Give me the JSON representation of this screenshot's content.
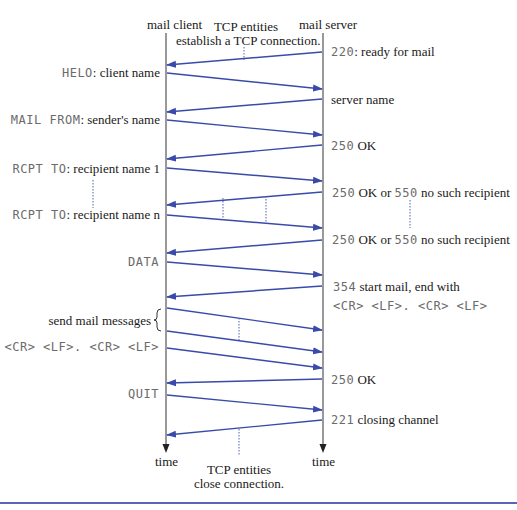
{
  "title_client": "mail client",
  "title_server": "mail server",
  "tcp_open_note": [
    "TCP entities",
    "establish a TCP connection."
  ],
  "tcp_close_note": [
    "TCP entities",
    "close connection."
  ],
  "time_label_client": "time",
  "time_label_server": "time",
  "colors": {
    "arrow": "#3a4aa8",
    "lifeline": "#555555",
    "dotted": "#5060b0",
    "rule": "#5a64b4"
  },
  "client_messages": [
    {
      "code": "HELO",
      "sep": ":",
      "text": " client name"
    },
    {
      "code": "MAIL FROM",
      "sep": ":",
      "text": " sender's name"
    },
    {
      "code": "RCPT TO",
      "sep": ":",
      "text": " recipient name 1"
    },
    {
      "code": "RCPT TO",
      "sep": ":",
      "text": " recipient name n"
    },
    {
      "code": "DATA",
      "sep": "",
      "text": ""
    },
    {
      "code": "",
      "sep": "",
      "text": "send mail messages"
    },
    {
      "code": "<CR> <LF>. <CR> <LF>",
      "sep": "",
      "text": ""
    },
    {
      "code": "QUIT",
      "sep": "",
      "text": ""
    }
  ],
  "server_messages": [
    {
      "code": "220",
      "text": ": ready for mail"
    },
    {
      "code": "",
      "text": "server name"
    },
    {
      "code": "250",
      "text": " OK"
    },
    {
      "code": "250",
      "text": "  OK or ",
      "code2": "550",
      "text2": " no such recipient"
    },
    {
      "code": "250",
      "text": "  OK or ",
      "code2": "550",
      "text2": " no such recipient"
    },
    {
      "code": "354",
      "text": "  start mail, end with",
      "line2": "<CR> <LF>. <CR> <LF>"
    },
    {
      "code": "250",
      "text": " OK"
    },
    {
      "code": "221",
      "text": " closing channel"
    }
  ],
  "arrows": [
    {
      "from": "server",
      "y1": 52,
      "y2": 65
    },
    {
      "from": "client",
      "y1": 73,
      "y2": 89
    },
    {
      "from": "server",
      "y1": 99,
      "y2": 112
    },
    {
      "from": "client",
      "y1": 120,
      "y2": 135
    },
    {
      "from": "server",
      "y1": 145,
      "y2": 159
    },
    {
      "from": "client",
      "y1": 168,
      "y2": 181
    },
    {
      "from": "server",
      "y1": 192,
      "y2": 205
    },
    {
      "from": "client",
      "y1": 215,
      "y2": 228
    },
    {
      "from": "server",
      "y1": 240,
      "y2": 253
    },
    {
      "from": "client",
      "y1": 262,
      "y2": 275
    },
    {
      "from": "server",
      "y1": 286,
      "y2": 297
    },
    {
      "from": "client",
      "y1": 308,
      "y2": 330
    },
    {
      "from": "client",
      "y1": 331,
      "y2": 352
    },
    {
      "from": "client",
      "y1": 348,
      "y2": 368
    },
    {
      "from": "server",
      "y1": 379,
      "y2": 383
    },
    {
      "from": "client",
      "y1": 395,
      "y2": 410
    },
    {
      "from": "server",
      "y1": 420,
      "y2": 435
    }
  ]
}
